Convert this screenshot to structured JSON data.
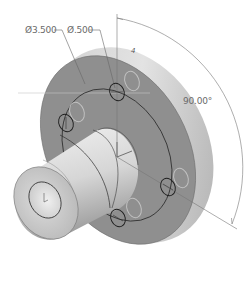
{
  "view": {
    "type": "isometric-part-view",
    "part": "flanged hub"
  },
  "dimensions": {
    "bolt_circle_diameter": "Ø3.500",
    "hole_diameter": "Ø.500",
    "angle": "90.00°",
    "hole_count_marker": "4"
  },
  "colors": {
    "flange_face": "#8e8e8e",
    "flange_rim": "#d4d4d4",
    "hub": "#d9d9d9",
    "hub_end": "#c8c8c8",
    "bore": "#e6e6e6",
    "dimension_line": "#777777",
    "edge_line": "#2b2b2b",
    "hidden_hole": "#b9b9b9"
  }
}
